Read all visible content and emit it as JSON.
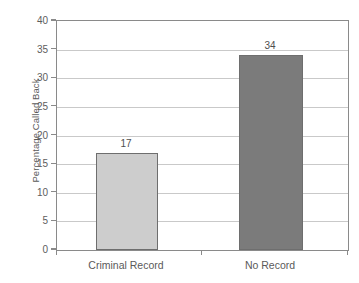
{
  "chart_data": {
    "type": "bar",
    "title": "",
    "xlabel": "",
    "ylabel": "Percentage Called Back",
    "categories": [
      "Criminal Record",
      "No Record"
    ],
    "values": [
      17,
      34
    ],
    "value_labels": [
      "17",
      "34"
    ],
    "bar_colors": [
      "#cdcdcd",
      "#7b7b7b"
    ],
    "bar_border_color": "#6e6e6e",
    "ylim": [
      0,
      40
    ],
    "ytick_labels": [
      "0",
      "5",
      "10",
      "15",
      "20",
      "25",
      "30",
      "35",
      "40"
    ],
    "ytick_values": [
      0,
      5,
      10,
      15,
      20,
      25,
      30,
      35,
      40
    ],
    "grid": "horizontal",
    "gridline_color": "#c9c9c9",
    "axis_color": "#8a8a8a",
    "legend": "none",
    "background": "#ffffff"
  }
}
